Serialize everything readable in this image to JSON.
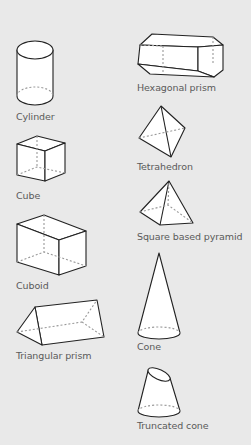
{
  "colors": {
    "background": "#e9e9e9",
    "outline": "#222222",
    "fill": "#ffffff",
    "hidden_edge": "#999999",
    "label": "#5a5a5a"
  },
  "shapes": [
    {
      "id": "cylinder",
      "label": "Cylinder"
    },
    {
      "id": "cube",
      "label": "Cube"
    },
    {
      "id": "cuboid",
      "label": "Cuboid"
    },
    {
      "id": "triangular-prism",
      "label": "Triangular prism"
    },
    {
      "id": "hexagonal-prism",
      "label": "Hexagonal prism"
    },
    {
      "id": "tetrahedron",
      "label": "Tetrahedron"
    },
    {
      "id": "square-based-pyramid",
      "label": "Square based pyramid"
    },
    {
      "id": "cone",
      "label": "Cone"
    },
    {
      "id": "truncated-cone",
      "label": "Truncated cone"
    }
  ]
}
